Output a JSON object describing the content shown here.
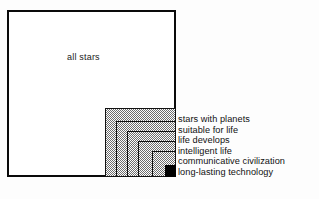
{
  "figure": {
    "title_region": "drake-equation-nested-boxes",
    "outer": {
      "label": "all stars",
      "fill": "#ffffff",
      "stroke": "#0a0a0a"
    },
    "palette": {
      "background": "#fdfdfd",
      "line": "#111111",
      "dither_gray": "#6e6e6e",
      "solid_fill": "#000000"
    },
    "nested_labels": [
      "stars with planets",
      "suitable for life",
      "life  develops",
      "intelligent life",
      "communicative civilization",
      "long-lasting technology"
    ]
  },
  "chart_data": {
    "type": "area",
    "title": "",
    "subtitle": "",
    "xlabel": "",
    "ylabel": "",
    "grid": false,
    "legend_position": "right",
    "categories": [
      "all stars",
      "stars with planets",
      "suitable for life",
      "life  develops",
      "intelligent life",
      "communicative civilization",
      "long-lasting technology"
    ],
    "series": [
      {
        "name": "relative square side (px)",
        "values": [
          169,
          71,
          60,
          49,
          38,
          24,
          11
        ]
      },
      {
        "name": "relative area fraction of all stars",
        "values": [
          1.0,
          0.171,
          0.118,
          0.079,
          0.048,
          0.022,
          0.0042
        ]
      }
    ],
    "annotations": [
      {
        "text": "all stars",
        "target": "outermost square",
        "fill": "white"
      },
      {
        "text": "stars with planets",
        "target": "square 2",
        "fill": "dithered gray"
      },
      {
        "text": "suitable for life",
        "target": "square 3",
        "fill": "dithered gray"
      },
      {
        "text": "life  develops",
        "target": "square 4",
        "fill": "dithered gray"
      },
      {
        "text": "intelligent life",
        "target": "square 5",
        "fill": "dithered gray"
      },
      {
        "text": "communicative civilization",
        "target": "square 6",
        "fill": "dithered gray"
      },
      {
        "text": "long-lasting technology",
        "target": "innermost square",
        "fill": "solid black"
      }
    ]
  }
}
